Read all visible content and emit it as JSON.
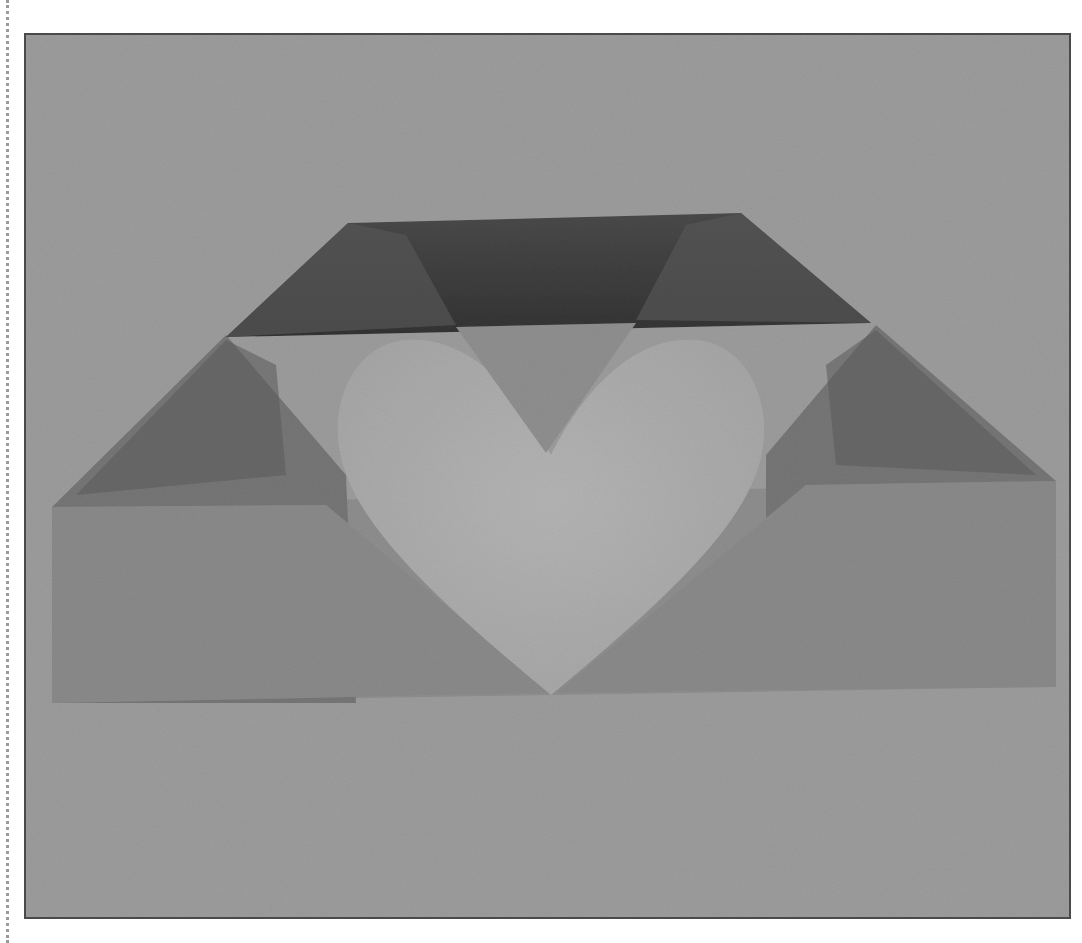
{
  "image": {
    "subject": "folded paper heart",
    "colors": {
      "page_background": "#ffffff",
      "photo_background": "#9c9c9c",
      "frame_border": "#4a4a4a",
      "top_band_dark": "#3c3c3c",
      "side_flap_mid": "#707070",
      "lower_panel": "#8c8c8c",
      "heart_light": "#b0b0b0",
      "inner_triangle": "#8e8e8e"
    }
  }
}
